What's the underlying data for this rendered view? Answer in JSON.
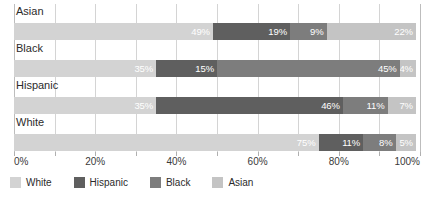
{
  "chart_data": {
    "type": "bar",
    "subtype": "stacked-horizontal-100pct",
    "title": "",
    "subtitle": "",
    "xlabel": "",
    "ylabel": "",
    "orientation": "horizontal",
    "stacked": true,
    "normalized_percent": true,
    "xlim": [
      0,
      100
    ],
    "xtick_interval": 10,
    "xlabel_interval": 20,
    "grid": true,
    "grid_axis": "x",
    "legend_position": "bottom-left",
    "categories": [
      "Asian",
      "Black",
      "Hispanic",
      "White"
    ],
    "tick_labels": [
      "0%",
      "20%",
      "40%",
      "60%",
      "80%",
      "100%"
    ],
    "tick_values": [
      0,
      20,
      40,
      60,
      80,
      100
    ],
    "series": [
      {
        "name": "White",
        "color": "#d3d3d3",
        "values": [
          49,
          35,
          35,
          75
        ]
      },
      {
        "name": "Hispanic",
        "color": "#5f5f5f",
        "values": [
          19,
          15,
          46,
          11
        ]
      },
      {
        "name": "Black",
        "color": "#7d7d7d",
        "values": [
          9,
          45,
          11,
          8
        ]
      },
      {
        "name": "Asian",
        "color": "#c4c4c4",
        "values": [
          22,
          4,
          7,
          5
        ]
      }
    ],
    "rows": [
      {
        "category": "Asian",
        "segments": [
          {
            "series": "White",
            "value": 49,
            "label": "49%"
          },
          {
            "series": "Hispanic",
            "value": 19,
            "label": "19%"
          },
          {
            "series": "Black",
            "value": 9,
            "label": "9%"
          },
          {
            "series": "Asian",
            "value": 22,
            "label": "22%"
          }
        ]
      },
      {
        "category": "Black",
        "segments": [
          {
            "series": "White",
            "value": 35,
            "label": "35%"
          },
          {
            "series": "Hispanic",
            "value": 15,
            "label": "15%"
          },
          {
            "series": "Black",
            "value": 45,
            "label": "45%"
          },
          {
            "series": "Asian",
            "value": 4,
            "label": "4%"
          }
        ]
      },
      {
        "category": "Hispanic",
        "segments": [
          {
            "series": "White",
            "value": 35,
            "label": "35%"
          },
          {
            "series": "Hispanic",
            "value": 46,
            "label": "46%"
          },
          {
            "series": "Black",
            "value": 11,
            "label": "11%"
          },
          {
            "series": "Asian",
            "value": 7,
            "label": "7%"
          }
        ]
      },
      {
        "category": "White",
        "segments": [
          {
            "series": "White",
            "value": 75,
            "label": "75%"
          },
          {
            "series": "Hispanic",
            "value": 11,
            "label": "11%"
          },
          {
            "series": "Black",
            "value": 8,
            "label": "8%"
          },
          {
            "series": "Asian",
            "value": 5,
            "label": "5%"
          }
        ]
      }
    ]
  },
  "legend": {
    "items": [
      {
        "label": "White",
        "color": "#d3d3d3"
      },
      {
        "label": "Hispanic",
        "color": "#5f5f5f"
      },
      {
        "label": "Black",
        "color": "#7d7d7d"
      },
      {
        "label": "Asian",
        "color": "#c4c4c4"
      }
    ]
  },
  "colors": {
    "background": "#ffffff",
    "gridline": "#d4d4d4",
    "axis": "#bdbdbd",
    "text": "#2b2b2b",
    "datalabel": "#ffffff"
  }
}
